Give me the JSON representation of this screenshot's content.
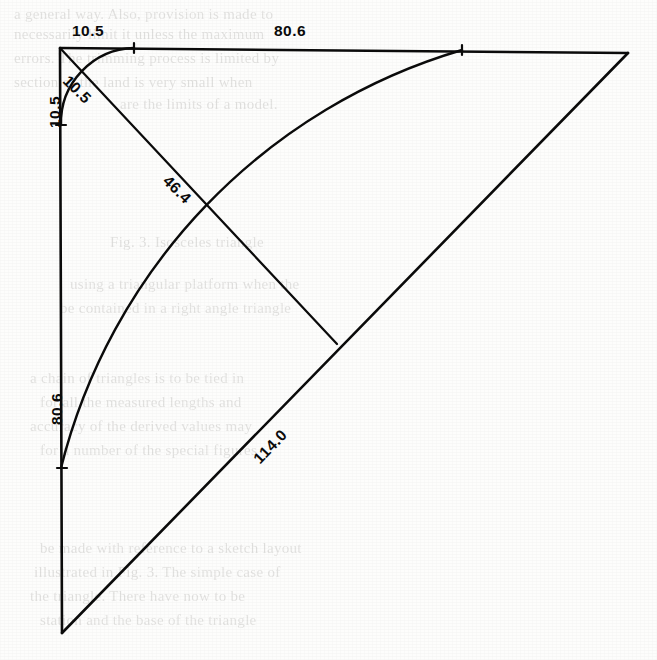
{
  "document": {
    "type": "scanned-engineering-diagram",
    "title": "Triangular construction diagram with arcs",
    "background_color": "#fdfdfc",
    "ink_color": "#0b0b0b",
    "width": 657,
    "height": 660
  },
  "diagram": {
    "vertices": {
      "top_left": {
        "x": 60,
        "y": 48
      },
      "top_right": {
        "x": 628,
        "y": 53
      },
      "bottom_left": {
        "x": 62,
        "y": 633
      },
      "diagonal_end": {
        "x": 337,
        "y": 344
      }
    },
    "edges": [
      {
        "name": "top-horizontal-edge",
        "from": "top_left",
        "to": "top_right"
      },
      {
        "name": "left-vertical-edge",
        "from": "top_left",
        "to": "bottom_left"
      },
      {
        "name": "hypotenuse-edge",
        "from": "bottom_left",
        "to": "top_right"
      },
      {
        "name": "inner-diagonal-edge",
        "from": "top_left",
        "to": "diagonal_end"
      }
    ],
    "arcs": [
      {
        "name": "small-corner-arc",
        "center": "top_left",
        "radius": 75,
        "from_x": 134,
        "from_y": 48,
        "to_x": 61,
        "to_y": 125
      },
      {
        "name": "large-sweep-arc",
        "center": "bottom_left",
        "radius": 583,
        "from_x": 462,
        "from_y": 50,
        "to_x": 61,
        "to_y": 468
      }
    ],
    "tick_marks": [
      {
        "name": "tick-top-small-arc",
        "x": 134,
        "y": 48
      },
      {
        "name": "tick-left-small-arc",
        "x": 61,
        "y": 125
      },
      {
        "name": "tick-top-large-arc",
        "x": 462,
        "y": 50
      },
      {
        "name": "tick-left-large-arc",
        "x": 61,
        "y": 468
      }
    ]
  },
  "labels": {
    "top_left_segment": {
      "text": "10.5",
      "x": 72,
      "y": 22,
      "rotation": 0,
      "name": "dimension-label-top-left-10-5"
    },
    "top_main_segment": {
      "text": "80.6",
      "x": 274,
      "y": 22,
      "rotation": 0,
      "name": "dimension-label-top-80-6"
    },
    "left_upper_segment": {
      "text": "10.5",
      "x": 46,
      "y": 128,
      "rotation": -90,
      "name": "dimension-label-left-10-5"
    },
    "inner_diagonal_short": {
      "text": "10.5",
      "x": 72,
      "y": 72,
      "rotation": 45,
      "name": "dimension-label-diagonal-10-5"
    },
    "inner_diagonal_long": {
      "text": "46.4",
      "x": 172,
      "y": 172,
      "rotation": 45,
      "name": "dimension-label-diagonal-46-4"
    },
    "left_lower_segment": {
      "text": "80.6",
      "x": 48,
      "y": 425,
      "rotation": -90,
      "name": "dimension-label-left-80-6"
    },
    "hypotenuse": {
      "text": "114.0",
      "x": 250,
      "y": 455,
      "rotation": -46,
      "name": "dimension-label-hypotenuse-114-0"
    }
  },
  "background_page_text": {
    "description": "faint show-through text from the reverse side of the scanned book page",
    "lines": [
      {
        "text": "a general way.  Also, provision is made to",
        "x": 14,
        "y": 6,
        "size": 15
      },
      {
        "text": "necessarily limit it unless the maximum",
        "x": 14,
        "y": 26,
        "size": 15
      },
      {
        "text": "errors.  The trimming process is limited by",
        "x": 14,
        "y": 50,
        "size": 15
      },
      {
        "text": "section of the land is very small when",
        "x": 14,
        "y": 74,
        "size": 15
      },
      {
        "text": "are the limits of a model.",
        "x": 120,
        "y": 96,
        "size": 15
      },
      {
        "text": "Fig. 3.  Isosceles triangle",
        "x": 110,
        "y": 234,
        "size": 15
      },
      {
        "text": "using  a  triangular  platform  when  the",
        "x": 70,
        "y": 276,
        "size": 15
      },
      {
        "text": "be contained in a right angle triangle",
        "x": 60,
        "y": 300,
        "size": 15
      },
      {
        "text": "a  chain  of  triangles  is  to  be  tied  in",
        "x": 30,
        "y": 370,
        "size": 15
      },
      {
        "text": "for  all  the  measured  lengths  and",
        "x": 40,
        "y": 394,
        "size": 15
      },
      {
        "text": "accuracy  of  the  derived  values  may",
        "x": 30,
        "y": 418,
        "size": 15
      },
      {
        "text": "for  a  number  of  the  special  figures",
        "x": 40,
        "y": 442,
        "size": 15
      },
      {
        "text": "be made with reference to a sketch layout",
        "x": 40,
        "y": 540,
        "size": 15
      },
      {
        "text": "illustrated in Fig. 3.  The simple case of",
        "x": 34,
        "y": 564,
        "size": 15
      },
      {
        "text": "the  triangle.  There  have  now  to  be",
        "x": 30,
        "y": 588,
        "size": 15
      },
      {
        "text": "station and the base of the triangle",
        "x": 40,
        "y": 612,
        "size": 15
      }
    ]
  }
}
